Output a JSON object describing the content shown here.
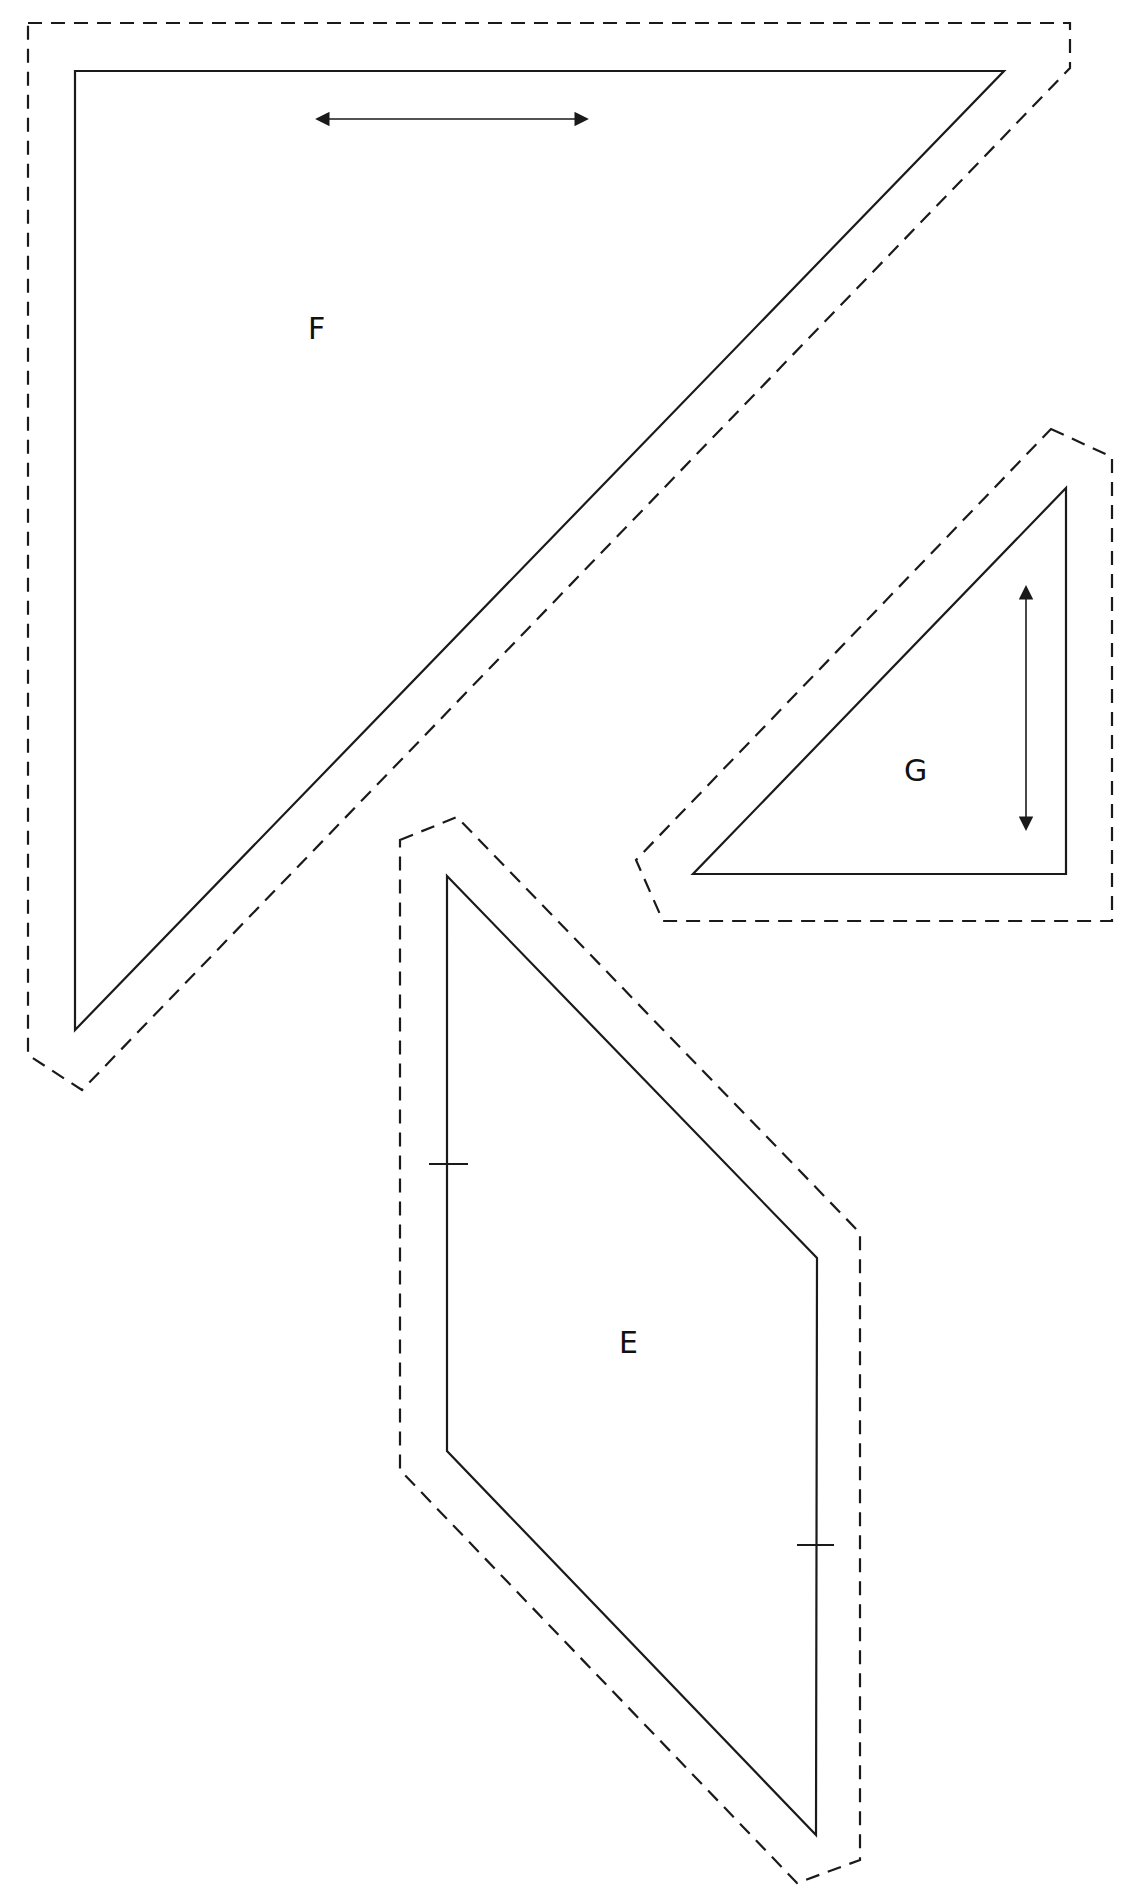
{
  "diagram": {
    "type": "quilt pattern templates",
    "stroke_color": "#1a1a1a",
    "background": "#ffffff",
    "legend": {
      "solid_line": "cutting/sewing line",
      "dashed_line": "seam allowance",
      "double_arrow": "grain line",
      "tick_marks": "matching marks"
    },
    "pieces": [
      {
        "label": "F",
        "shape": "right triangle",
        "grain_arrow": "horizontal",
        "solid": [
          [
            75,
            71
          ],
          [
            1004,
            71
          ],
          [
            75,
            1030
          ]
        ],
        "dashed": [
          [
            28,
            23
          ],
          [
            1070,
            23
          ],
          [
            1070,
            68
          ],
          [
            82,
            1090
          ],
          [
            28,
            1055
          ]
        ]
      },
      {
        "label": "G",
        "shape": "right triangle",
        "grain_arrow": "vertical",
        "solid": [
          [
            1066,
            488
          ],
          [
            1066,
            874
          ],
          [
            693,
            874
          ]
        ],
        "dashed": [
          [
            1051,
            429
          ],
          [
            1112,
            457
          ],
          [
            1112,
            921
          ],
          [
            663,
            921
          ],
          [
            636,
            860
          ]
        ]
      },
      {
        "label": "E",
        "shape": "parallelogram",
        "grain_arrow": "none",
        "match_marks": 2,
        "solid": [
          [
            447,
            876
          ],
          [
            817,
            1258
          ],
          [
            816,
            1835
          ],
          [
            447,
            1451
          ]
        ],
        "dashed": [
          [
            400,
            840
          ],
          [
            457,
            817
          ],
          [
            860,
            1233
          ],
          [
            860,
            1860
          ],
          [
            797,
            1883
          ],
          [
            400,
            1470
          ]
        ]
      }
    ]
  },
  "labels": {
    "F": "F",
    "G": "G",
    "E": "E"
  }
}
